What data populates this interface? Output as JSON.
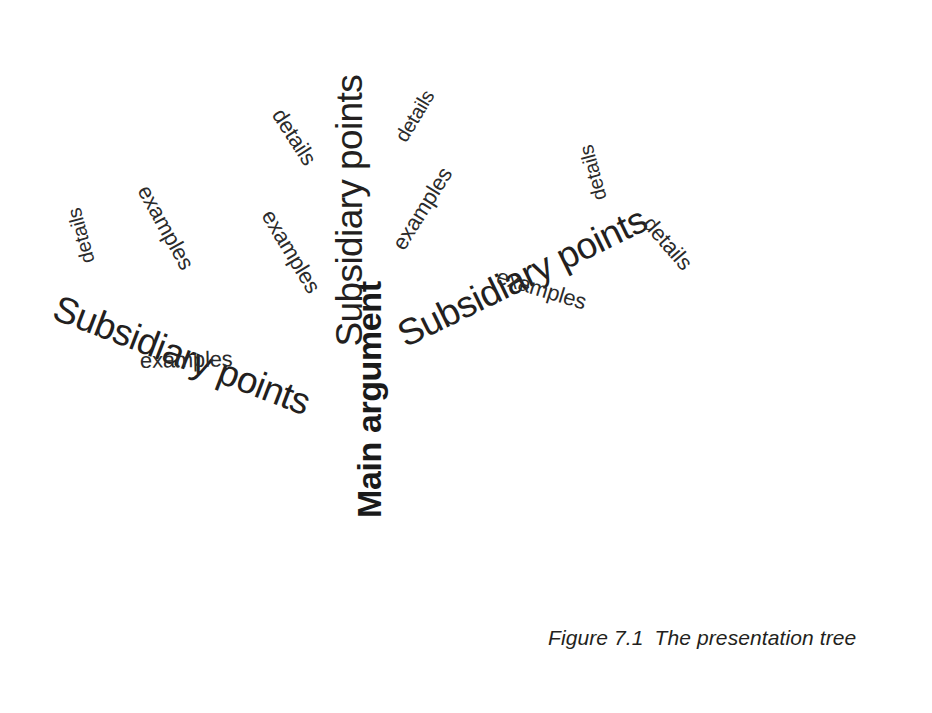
{
  "figure": {
    "caption_label": "Figure 7.1",
    "caption_text": "The presentation tree",
    "background_color": "#ffffff",
    "text_color": "#231f20"
  },
  "tree": {
    "trunk": {
      "label": "Main argument"
    },
    "branches": [
      {
        "id": "left",
        "label": "Subsidiary points"
      },
      {
        "id": "center",
        "label": "Subsidiary points"
      },
      {
        "id": "right",
        "label": "Subsidiary points"
      }
    ],
    "twigs": [
      {
        "id": "left-details",
        "label": "details"
      },
      {
        "id": "left-examples-upper",
        "label": "examples"
      },
      {
        "id": "left-examples-lower",
        "label": "examples"
      },
      {
        "id": "center-details-left",
        "label": "details"
      },
      {
        "id": "center-examples-left",
        "label": "examples"
      },
      {
        "id": "center-details-right",
        "label": "details"
      },
      {
        "id": "center-examples-right",
        "label": "examples"
      },
      {
        "id": "right-details-upper",
        "label": "details"
      },
      {
        "id": "right-examples",
        "label": "examples"
      },
      {
        "id": "right-details-outer",
        "label": "details"
      }
    ]
  }
}
